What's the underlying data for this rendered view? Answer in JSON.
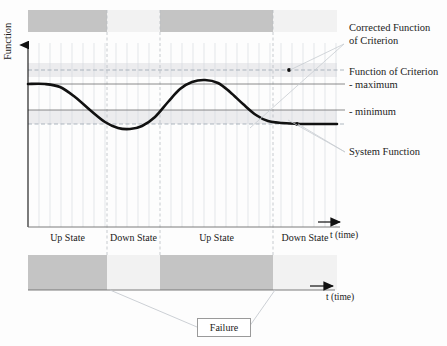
{
  "figure": {
    "type": "reliability-state-timing-diagram",
    "background": "#fdfdfd"
  },
  "axes": {
    "y_label": "Function",
    "x_label_upper": "t (time)",
    "x_label_lower": "t (time)",
    "y_axis_x": 28,
    "y_axis_top": 43,
    "upper_time_axis_y": 227,
    "lower_time_axis_y": 290,
    "plot_left": 28,
    "plot_right": 337
  },
  "annotations": [
    {
      "id": "corrected-function-of-criterion",
      "line1": "Corrected Function",
      "line2": "of Criterion",
      "x": 349,
      "y": 26
    },
    {
      "id": "function-of-criterion-maximum",
      "line1": "Function of Criterion",
      "line2": "- maximum",
      "x": 349,
      "y": 70
    },
    {
      "id": "minimum",
      "line1": "- minimum",
      "line2": "",
      "x": 349,
      "y": 110
    },
    {
      "id": "system-function",
      "line1": "System Function",
      "line2": "",
      "x": 349,
      "y": 150
    }
  ],
  "reference_lines": [
    {
      "id": "corrected-function-of-criterion-line",
      "y": 70,
      "style": "dashed",
      "color": "#9aa4ae"
    },
    {
      "id": "function-of-criterion-maximum-line",
      "y": 84,
      "style": "solid",
      "color": "#6d6d6d"
    },
    {
      "id": "function-of-criterion-minimum-line",
      "y": 110,
      "style": "solid",
      "color": "#6d6d6d"
    },
    {
      "id": "lower-band-dashed-line",
      "y": 124,
      "style": "dashed",
      "color": "#9aa4ae"
    }
  ],
  "leader_dots": [
    {
      "id": "dot-corrected-function",
      "x": 289,
      "y": 70
    },
    {
      "id": "dot-system-function",
      "x": 297,
      "y": 124
    }
  ],
  "shaded_bands": [
    {
      "id": "upper-tolerance-band",
      "y": 63,
      "height": 14,
      "color": "#eceef0"
    },
    {
      "id": "lower-tolerance-band",
      "y": 110,
      "height": 14,
      "color": "#eceef0"
    }
  ],
  "state_timeline": {
    "top_band": {
      "y": 10,
      "height": 22
    },
    "bottom_band": {
      "y": 255,
      "height": 35
    },
    "colors": {
      "up": "#c4c4c4",
      "down": "#f2f2f2"
    },
    "segments": [
      {
        "label": "Up State",
        "state": "up",
        "x0": 28,
        "x1": 107
      },
      {
        "label": "Down State",
        "state": "down",
        "x0": 107,
        "x1": 160
      },
      {
        "label": "Up State",
        "state": "up",
        "x0": 160,
        "x1": 273
      },
      {
        "label": "Down State",
        "state": "down",
        "x0": 273,
        "x1": 337
      }
    ],
    "label_y": 237
  },
  "failure": {
    "label": "Failure",
    "pointer_targets": [
      {
        "x": 110,
        "y": 290
      },
      {
        "x": 275,
        "y": 290
      }
    ]
  },
  "system_function_curve": {
    "name": "System Function",
    "color": "#111111",
    "stroke_width": 2.6,
    "description": "Smooth wave: starts high at plateau, dips to minimum, rises to maximum, then decays to a low plateau.",
    "points_xy": [
      [
        28,
        84
      ],
      [
        45,
        84
      ],
      [
        60,
        87
      ],
      [
        75,
        97
      ],
      [
        90,
        110
      ],
      [
        105,
        122
      ],
      [
        118,
        128
      ],
      [
        130,
        129
      ],
      [
        142,
        126
      ],
      [
        155,
        117
      ],
      [
        168,
        102
      ],
      [
        180,
        89
      ],
      [
        192,
        82
      ],
      [
        205,
        80
      ],
      [
        218,
        83
      ],
      [
        230,
        92
      ],
      [
        243,
        104
      ],
      [
        256,
        115
      ],
      [
        268,
        121
      ],
      [
        282,
        123
      ],
      [
        300,
        124
      ],
      [
        320,
        124
      ],
      [
        337,
        124
      ]
    ]
  },
  "grid": {
    "vertical_tick_spacing": 11,
    "vertical_line_color": "#d9dde1",
    "dashed_separator_x": 160,
    "top": 43,
    "bottom": 227
  }
}
